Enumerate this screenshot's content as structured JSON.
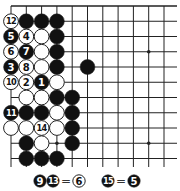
{
  "diagram": {
    "type": "go-board-diagram",
    "grid": {
      "x0": 11,
      "y0": 6,
      "dx": 15.3,
      "dy": 15.25,
      "cols": 11,
      "rows": 11,
      "line_right_end": 177,
      "line_bottom_end": 167,
      "left_line_top": 6,
      "top_edge": true
    },
    "star_points": [
      {
        "col": 3,
        "row": 3
      },
      {
        "col": 9,
        "row": 3
      },
      {
        "col": 3,
        "row": 9
      },
      {
        "col": 9,
        "row": 9
      }
    ],
    "stones": [
      {
        "col": 0,
        "row": 1,
        "color": "white",
        "label": "12"
      },
      {
        "col": 1,
        "row": 1,
        "color": "black",
        "label": ""
      },
      {
        "col": 2,
        "row": 1,
        "color": "black",
        "label": ""
      },
      {
        "col": 3,
        "row": 1,
        "color": "black",
        "label": ""
      },
      {
        "col": 0,
        "row": 2,
        "color": "black",
        "label": "5"
      },
      {
        "col": 1,
        "row": 2,
        "color": "white",
        "label": "4"
      },
      {
        "col": 2,
        "row": 2,
        "color": "white",
        "label": ""
      },
      {
        "col": 3,
        "row": 2,
        "color": "black",
        "label": ""
      },
      {
        "col": 0,
        "row": 3,
        "color": "white",
        "label": "6"
      },
      {
        "col": 1,
        "row": 3,
        "color": "black",
        "label": "7"
      },
      {
        "col": 2,
        "row": 3,
        "color": "white",
        "label": ""
      },
      {
        "col": 3,
        "row": 3,
        "color": "black",
        "label": ""
      },
      {
        "col": 0,
        "row": 4,
        "color": "black",
        "label": "3"
      },
      {
        "col": 1,
        "row": 4,
        "color": "white",
        "label": "8"
      },
      {
        "col": 2,
        "row": 4,
        "color": "white",
        "label": ""
      },
      {
        "col": 3,
        "row": 4,
        "color": "black",
        "label": ""
      },
      {
        "col": 5,
        "row": 4,
        "color": "black",
        "label": ""
      },
      {
        "col": 0,
        "row": 5,
        "color": "white",
        "label": "10"
      },
      {
        "col": 1,
        "row": 5,
        "color": "white",
        "label": "2"
      },
      {
        "col": 2,
        "row": 5,
        "color": "black",
        "label": "1"
      },
      {
        "col": 3,
        "row": 5,
        "color": "white",
        "label": ""
      },
      {
        "col": 1,
        "row": 6,
        "color": "white",
        "label": ""
      },
      {
        "col": 2,
        "row": 6,
        "color": "white",
        "label": ""
      },
      {
        "col": 3,
        "row": 6,
        "color": "black",
        "label": ""
      },
      {
        "col": 4,
        "row": 6,
        "color": "black",
        "label": ""
      },
      {
        "col": 0,
        "row": 7,
        "color": "black",
        "label": "11"
      },
      {
        "col": 1,
        "row": 7,
        "color": "black",
        "label": ""
      },
      {
        "col": 2,
        "row": 7,
        "color": "black",
        "label": ""
      },
      {
        "col": 3,
        "row": 7,
        "color": "white",
        "label": ""
      },
      {
        "col": 4,
        "row": 7,
        "color": "black",
        "label": ""
      },
      {
        "col": 0,
        "row": 8,
        "color": "white",
        "label": ""
      },
      {
        "col": 1,
        "row": 8,
        "color": "white",
        "label": ""
      },
      {
        "col": 2,
        "row": 8,
        "color": "white",
        "label": "14"
      },
      {
        "col": 3,
        "row": 8,
        "color": "white",
        "label": ""
      },
      {
        "col": 4,
        "row": 8,
        "color": "black",
        "label": ""
      },
      {
        "col": 1,
        "row": 9,
        "color": "black",
        "label": ""
      },
      {
        "col": 2,
        "row": 9,
        "color": "white",
        "label": ""
      },
      {
        "col": 4,
        "row": 9,
        "color": "black",
        "label": ""
      },
      {
        "col": 1,
        "row": 10,
        "color": "black",
        "label": ""
      },
      {
        "col": 2,
        "row": 10,
        "color": "black",
        "label": ""
      },
      {
        "col": 3,
        "row": 10,
        "color": "black",
        "label": ""
      }
    ],
    "caption": {
      "items": [
        {
          "kind": "stone",
          "color": "black",
          "label": "9",
          "x": 40
        },
        {
          "kind": "stone",
          "color": "black",
          "label": "13",
          "x": 53
        },
        {
          "kind": "text",
          "label": "=",
          "x": 66
        },
        {
          "kind": "stone",
          "color": "white",
          "label": "6",
          "x": 79
        },
        {
          "kind": "stone",
          "color": "black",
          "label": "15",
          "x": 108
        },
        {
          "kind": "text",
          "label": "=",
          "x": 121
        },
        {
          "kind": "stone",
          "color": "black",
          "label": "5",
          "x": 134
        }
      ],
      "text": "9 13 = 6   15 = 5"
    },
    "colors": {
      "background": "#ffffff",
      "line": "#222222",
      "black_stone": "#111111",
      "white_stone": "#ffffff",
      "stone_outline": "#222222"
    }
  }
}
